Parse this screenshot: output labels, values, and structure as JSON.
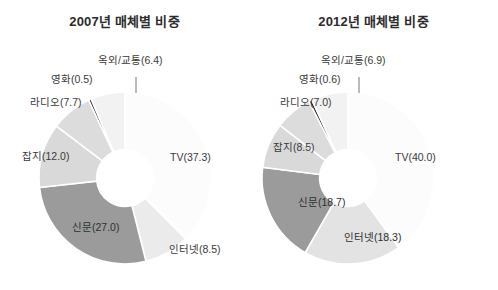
{
  "figure": {
    "background": "#ffffff",
    "width": 498,
    "height": 290
  },
  "panels": [
    {
      "id": "panel-2007",
      "title": "2007년 매체별 비중",
      "labels": {
        "tv": "TV(37.3)",
        "internet": "인터넷(8.5)",
        "newspaper": "신문(27.0)",
        "magazine": "잡지(12.0)",
        "radio": "라디오(7.7)",
        "movie": "영화(0.5)",
        "outdoor": "옥외/교통(6.4)"
      }
    },
    {
      "id": "panel-2012",
      "title": "2012년 매체별 비중",
      "labels": {
        "tv": "TV(40.0)",
        "internet": "인터넷(18.3)",
        "newspaper": "신문(18.7)",
        "magazine": "잡지(8.5)",
        "radio": "라디오(7.0)",
        "movie": "영화(0.6)",
        "outdoor": "옥외/교통(6.9)"
      }
    }
  ],
  "chart_data": [
    {
      "type": "pie",
      "variant": "donut",
      "title": "2007년 매체별 비중",
      "unit": "percent",
      "categories": [
        "TV",
        "인터넷",
        "신문",
        "잡지",
        "라디오",
        "영화",
        "옥외/교통"
      ],
      "values": [
        37.3,
        8.5,
        27.0,
        12.0,
        7.7,
        0.5,
        6.4
      ],
      "labels": [
        "TV(37.3)",
        "인터넷(8.5)",
        "신문(27.0)",
        "잡지(12.0)",
        "라디오(7.7)",
        "영화(0.5)",
        "옥외/교통(6.4)"
      ],
      "colors": [
        "#fcfcfc",
        "#ebebeb",
        "#9b9b9b",
        "#d9d9d9",
        "#dcdcdc",
        "#2a2a2a",
        "#f2f2f2"
      ],
      "start_angle_deg": 0,
      "direction": "clockwise",
      "inner_radius_ratio": 0.33,
      "separator_color": "#ffffff",
      "legend": "none",
      "grid": false
    },
    {
      "type": "pie",
      "variant": "donut",
      "title": "2012년 매체별 비중",
      "unit": "percent",
      "categories": [
        "TV",
        "인터넷",
        "신문",
        "잡지",
        "라디오",
        "영화",
        "옥외/교통"
      ],
      "values": [
        40.0,
        18.3,
        18.7,
        8.5,
        7.0,
        0.6,
        6.9
      ],
      "labels": [
        "TV(40.0)",
        "인터넷(18.3)",
        "신문(18.7)",
        "잡지(8.5)",
        "라디오(7.0)",
        "영화(0.6)",
        "옥외/교통(6.9)"
      ],
      "colors": [
        "#fcfcfc",
        "#e3e3e3",
        "#9b9b9b",
        "#d9d9d9",
        "#dcdcdc",
        "#2a2a2a",
        "#f2f2f2"
      ],
      "start_angle_deg": 0,
      "direction": "clockwise",
      "inner_radius_ratio": 0.33,
      "separator_color": "#ffffff",
      "legend": "none",
      "grid": false
    }
  ]
}
